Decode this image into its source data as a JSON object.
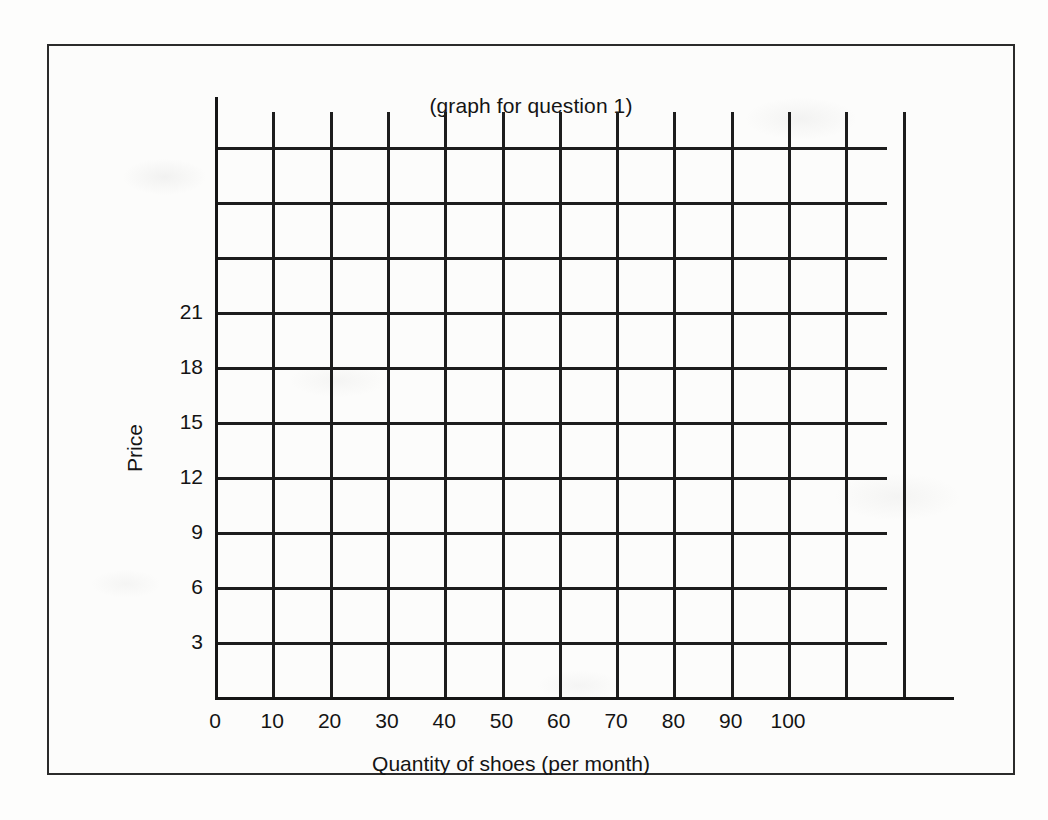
{
  "figure": {
    "title": "(graph for question 1)",
    "border_color": "#2b2b2b",
    "background_color": "#fcfcfb",
    "line_color": "#1d1d1d"
  },
  "chart_data": {
    "type": "line",
    "title": "(graph for question 1)",
    "xlabel": "Quantity of shoes (per month)",
    "ylabel": "Price",
    "grid": true,
    "legend": "none",
    "series": [],
    "note": "Empty grid template; no data plotted.",
    "xlim": [
      0,
      120
    ],
    "ylim": [
      0,
      33
    ],
    "x_tick_labels": [
      "0",
      "10",
      "20",
      "30",
      "40",
      "50",
      "60",
      "70",
      "80",
      "90",
      "100"
    ],
    "x_tick_values": [
      0,
      10,
      20,
      30,
      40,
      50,
      60,
      70,
      80,
      90,
      100
    ],
    "x_gridline_values": [
      0,
      10,
      20,
      30,
      40,
      50,
      60,
      70,
      80,
      90,
      100,
      110,
      120
    ],
    "y_tick_labels": [
      "3",
      "6",
      "9",
      "12",
      "15",
      "18",
      "21"
    ],
    "y_tick_values": [
      3,
      6,
      9,
      12,
      15,
      18,
      21
    ],
    "y_gridline_values": [
      3,
      6,
      9,
      12,
      15,
      18,
      21,
      24,
      27,
      30
    ]
  },
  "axes": {
    "x_title": "Quantity of shoes (per month)",
    "y_title": "Price",
    "x_labels": [
      "0",
      "10",
      "20",
      "30",
      "40",
      "50",
      "60",
      "70",
      "80",
      "90",
      "100"
    ],
    "y_labels": [
      "3",
      "6",
      "9",
      "12",
      "15",
      "18",
      "21"
    ]
  }
}
